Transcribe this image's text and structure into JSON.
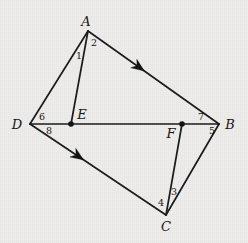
{
  "figure": {
    "background_color": "#eeedeb",
    "ink_color": "#141414",
    "width": 248,
    "height": 243,
    "vertices": [
      {
        "id": "A",
        "label": "A",
        "x": 88,
        "y": 31,
        "label_x": 86,
        "label_y": 21,
        "dot": false
      },
      {
        "id": "B",
        "label": "B",
        "x": 219,
        "y": 124,
        "label_x": 230,
        "label_y": 124,
        "dot": false
      },
      {
        "id": "C",
        "label": "C",
        "x": 166,
        "y": 215,
        "label_x": 166,
        "label_y": 226,
        "dot": false
      },
      {
        "id": "D",
        "label": "D",
        "x": 30,
        "y": 124,
        "label_x": 17,
        "label_y": 124,
        "dot": false
      },
      {
        "id": "E",
        "label": "E",
        "x": 71,
        "y": 124,
        "label_x": 82,
        "label_y": 114,
        "dot": true
      },
      {
        "id": "F",
        "label": "F",
        "x": 182,
        "y": 124,
        "label_x": 171,
        "label_y": 133,
        "dot": true
      }
    ],
    "edges": [
      {
        "id": "DA",
        "from": "D",
        "to": "A",
        "arrow": false
      },
      {
        "id": "AE",
        "from": "A",
        "to": "E",
        "arrow": false
      },
      {
        "id": "AB",
        "from": "A",
        "to": "B",
        "arrow": true,
        "arrow_t": 0.39,
        "arrow_name": "arrow-ab"
      },
      {
        "id": "DB",
        "from": "D",
        "to": "B",
        "arrow": false
      },
      {
        "id": "DC",
        "from": "D",
        "to": "C",
        "arrow": true,
        "arrow_t": 0.355,
        "arrow_name": "arrow-dc"
      },
      {
        "id": "FC",
        "from": "F",
        "to": "C",
        "arrow": false
      },
      {
        "id": "CB",
        "from": "C",
        "to": "B",
        "arrow": false
      }
    ],
    "angle_labels": [
      {
        "id": "angle-1",
        "text": "1",
        "x": 79,
        "y": 56
      },
      {
        "id": "angle-2",
        "text": "2",
        "x": 94,
        "y": 43
      },
      {
        "id": "angle-3",
        "text": "3",
        "x": 174,
        "y": 192
      },
      {
        "id": "angle-4",
        "text": "4",
        "x": 161,
        "y": 203
      },
      {
        "id": "angle-5",
        "text": "5",
        "x": 212,
        "y": 131
      },
      {
        "id": "angle-6",
        "text": "6",
        "x": 42,
        "y": 117
      },
      {
        "id": "angle-7",
        "text": "7",
        "x": 201,
        "y": 117
      },
      {
        "id": "angle-8",
        "text": "8",
        "x": 49,
        "y": 131
      }
    ]
  }
}
